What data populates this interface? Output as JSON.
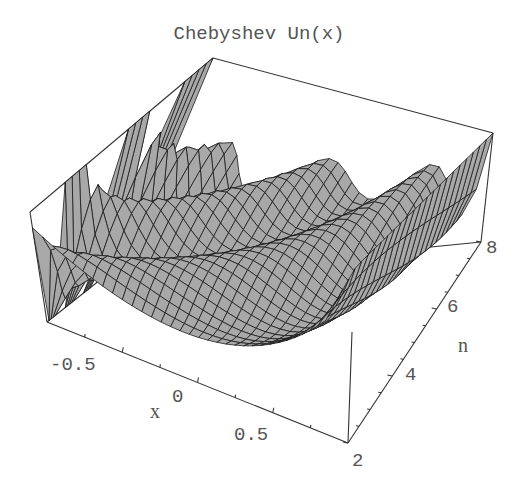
{
  "chart_data": {
    "type": "surface3d",
    "title": "Chebyshev Un(x)",
    "function": "U_n(x) = sin((n+1) arccos x) / sin(arccos x)",
    "x": {
      "label": "x",
      "range": [
        -1,
        1
      ],
      "ticks": [
        "-0.5",
        "0",
        "0.5"
      ],
      "tick_values": [
        -0.5,
        0,
        0.5
      ]
    },
    "y": {
      "label": "n",
      "range": [
        2,
        8
      ],
      "ticks": [
        "2",
        "4",
        "6",
        "8"
      ],
      "tick_values": [
        2,
        4,
        6,
        8
      ]
    },
    "z": {
      "label": "",
      "ticks": []
    },
    "mesh": true,
    "box": true,
    "surface_color": "#a8a8a8",
    "mesh_color": "#1a1a1a"
  },
  "labels": {
    "title": "Chebyshev Un(x)",
    "x_axis": "x",
    "n_axis": "n",
    "x_ticks": [
      "-0.5",
      "0",
      "0.5"
    ],
    "n_ticks": [
      "2",
      "4",
      "6",
      "8"
    ]
  }
}
